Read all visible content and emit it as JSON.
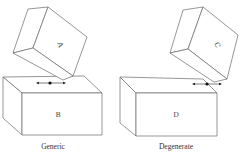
{
  "figure": {
    "panels": [
      {
        "id": "generic",
        "caption": "Generic",
        "top_block_label": "A",
        "bottom_block_label": "B"
      },
      {
        "id": "degenerate",
        "caption": "Degenerate",
        "top_block_label": "C",
        "bottom_block_label": "D"
      }
    ]
  }
}
